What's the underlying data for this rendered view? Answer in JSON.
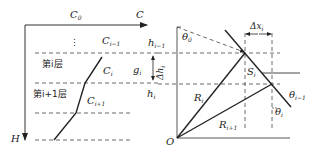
{
  "left_panel": {
    "axis_x_origin_label": "C",
    "axis_x_origin_sub": "0",
    "axis_x_label": "C",
    "axis_y_label": "H",
    "ellipsis": "⋮",
    "c_prev": "C",
    "c_prev_sub": "i−1",
    "c_i": "C",
    "c_i_sub": "i",
    "c_next": "C",
    "c_next_sub": "i+1",
    "layer_i": "第i层",
    "layer_i1": "第i+1层",
    "h_prev": "h",
    "h_prev_sub": "i−1",
    "g_i": "g",
    "g_i_sub": "i",
    "delta_h": "Δh",
    "delta_h_sub": "i",
    "h_i": "h",
    "h_i_sub": "i"
  },
  "right_panel": {
    "origin": "O",
    "theta0": "θ",
    "theta0_sub": "0",
    "delta_x": "Δx",
    "delta_x_sub": "i",
    "s_i": "S",
    "s_i_sub": "i",
    "r_i": "R",
    "r_i_sub": "i",
    "r_next": "R",
    "r_next_sub": "i+1",
    "theta_prev": "θ",
    "theta_prev_sub": "i−1",
    "theta_i": "θ",
    "theta_i_sub": "i"
  }
}
